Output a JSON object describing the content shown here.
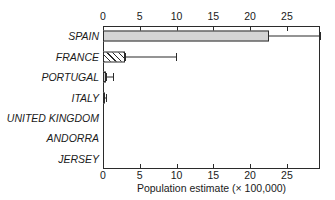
{
  "chart_data": {
    "type": "bar",
    "orientation": "horizontal",
    "title": "",
    "xlabel": "Population estimate (× 100,000)",
    "ylabel": "",
    "xlim": [
      0,
      29.5
    ],
    "xticks": [
      0,
      5,
      10,
      15,
      20,
      25
    ],
    "xtick_labels": [
      "0",
      "5",
      "10",
      "15",
      "20",
      "25"
    ],
    "xticks_top": true,
    "xticks_bottom": true,
    "grid": false,
    "legend": "none",
    "categories": [
      "SPAIN",
      "FRANCE",
      "PORTUGAL",
      "ITALY",
      "UNITED KINGDOM",
      "ANDORRA",
      "JERSEY"
    ],
    "values": [
      22.6,
      3.0,
      0.35,
      0.2,
      0.03,
      0.0,
      0.0
    ],
    "error_low": [
      16.9,
      3.0,
      0.35,
      0.2,
      0.03,
      0.0,
      0.0
    ],
    "error_high": [
      29.5,
      9.9,
      1.3,
      0.35,
      0.06,
      0.0,
      0.0
    ],
    "bar_styles": [
      "solid-fill",
      "hatch-fill",
      "solid-fill",
      "solid-fill",
      "zero-bar",
      "zero-bar",
      "zero-bar"
    ],
    "colors": {
      "bar_fill": "#d4d4d4",
      "bar_edge": "#2b2b2b",
      "hatch": "#2b2b2b",
      "axis": "#2b2b2b",
      "text": "#1a1a1a",
      "background": "#ffffff"
    }
  }
}
